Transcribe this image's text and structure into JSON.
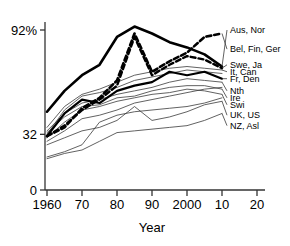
{
  "chart_data": {
    "type": "line",
    "title": "",
    "xlabel": "Year",
    "ylabel": "",
    "xlim": [
      1960,
      2020
    ],
    "ylim": [
      0,
      100
    ],
    "grid": false,
    "legend_position": "right-inline-labels",
    "x_tick_labels": [
      "1960",
      "70",
      "80",
      "90",
      "2000",
      "10",
      "20"
    ],
    "x_tick_values": [
      1960,
      1970,
      1980,
      1990,
      2000,
      2010,
      2020
    ],
    "y_tick_labels": [
      "0",
      "32",
      "92%"
    ],
    "y_tick_values": [
      0,
      32,
      92
    ],
    "x": [
      1960,
      1965,
      1970,
      1975,
      1980,
      1985,
      1990,
      1995,
      2000,
      2005,
      2010
    ],
    "series": [
      {
        "name": "Aus, Nor",
        "label": "Aus, Nor",
        "style": "thick-solid",
        "values": [
          45,
          57,
          66,
          72,
          88,
          94,
          90,
          85,
          82,
          78,
          71
        ],
        "label_y": 92
      },
      {
        "name": "Bel, Fin, Ger",
        "label": "Bel, Fin, Ger",
        "style": "thick-dashed",
        "values": [
          31,
          36,
          47,
          53,
          63,
          90,
          68,
          74,
          79,
          88,
          90
        ],
        "label_y": 81
      },
      {
        "name": "Swe, Ja",
        "label": "Swe, Ja",
        "style": "thick-dashed-2",
        "values": [
          31,
          37,
          46,
          52,
          60,
          88,
          66,
          72,
          77,
          75,
          70
        ],
        "label_y": 72
      },
      {
        "name": "It, Can",
        "label": "It, Can",
        "style": "thin",
        "values": [
          36,
          48,
          55,
          58,
          62,
          66,
          68,
          70,
          71,
          70,
          69
        ],
        "label_y": 68
      },
      {
        "name": "Fr, Den",
        "label": "Fr, Den",
        "style": "thick-solid-2",
        "values": [
          31,
          44,
          52,
          50,
          57,
          60,
          62,
          68,
          66,
          68,
          64
        ],
        "label_y": 64
      },
      {
        "name": "Nth",
        "label": "Nth",
        "style": "thin",
        "values": [
          34,
          44,
          50,
          52,
          55,
          57,
          59,
          62,
          64,
          63,
          62
        ],
        "label_y": 57
      },
      {
        "name": "Ire",
        "label": "Ire",
        "style": "thin",
        "values": [
          33,
          42,
          48,
          49,
          53,
          54,
          57,
          59,
          60,
          60,
          58
        ],
        "label_y": 53
      },
      {
        "name": "Swi",
        "label": "Swi",
        "style": "thin",
        "values": [
          30,
          39,
          46,
          48,
          51,
          53,
          55,
          56,
          58,
          57,
          55
        ],
        "label_y": 49
      },
      {
        "name": "UK, US",
        "label": "UK, US",
        "style": "thin",
        "values": [
          26,
          30,
          34,
          36,
          40,
          48,
          40,
          42,
          45,
          49,
          51
        ],
        "label_y": 43
      },
      {
        "name": "NZ, Asl",
        "label": "NZ, Asl",
        "style": "thin",
        "values": [
          18,
          21,
          23,
          28,
          33,
          34,
          35,
          36,
          37,
          40,
          44
        ],
        "label_y": 37
      },
      {
        "name": "unlabeled-a",
        "label": "",
        "style": "thin",
        "values": [
          32,
          46,
          54,
          56,
          59,
          63,
          65,
          67,
          69,
          68,
          67
        ],
        "label_y": null
      },
      {
        "name": "unlabeled-b",
        "label": "",
        "style": "thin",
        "values": [
          28,
          34,
          41,
          43,
          46,
          50,
          52,
          54,
          56,
          58,
          59
        ],
        "label_y": null
      },
      {
        "name": "unlabeled-c",
        "label": "",
        "style": "thin",
        "values": [
          19,
          22,
          26,
          39,
          43,
          45,
          46,
          47,
          48,
          50,
          53
        ],
        "label_y": null
      }
    ]
  },
  "axis": {
    "y_label_top": "92%",
    "y_label_mid": "32",
    "y_label_bottom": "0",
    "x_title": "Year"
  },
  "colors": {
    "line": "#000000",
    "thin_line": "#444444",
    "axis": "#333333",
    "background": "#ffffff"
  }
}
